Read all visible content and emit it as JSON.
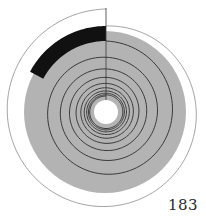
{
  "figure": {
    "colors": {
      "background": "#ffffff",
      "disk": "#b3b3b3",
      "band": "#111111",
      "lines": "#3a3a3a",
      "outline": "#8a8a8a"
    },
    "center": [
      106,
      112
    ],
    "hole_radius": 12,
    "disk_radius": 81,
    "spiral_turns": 9
  },
  "page_number": "183"
}
